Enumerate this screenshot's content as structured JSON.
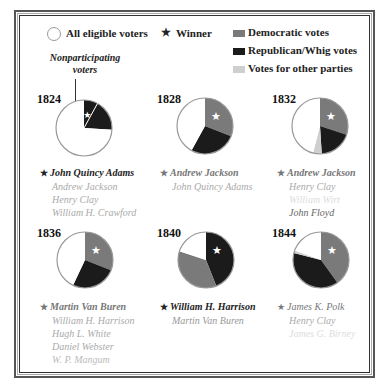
{
  "legend": {
    "all_eligible": "All eligible voters",
    "winner": "Winner",
    "democratic": "Democratic votes",
    "republican_whig": "Republican/Whig votes",
    "other": "Votes for other parties",
    "colors": {
      "democratic": "#7a7a7a",
      "republican_whig": "#1b1b1b",
      "other": "#cfcfcf",
      "nonparticipating": "#ffffff",
      "outline": "#999999"
    }
  },
  "annotation": {
    "line1": "Nonparticipating",
    "line2": "voters"
  },
  "elections": [
    {
      "year": "1824",
      "candidates": [
        {
          "name": "John Quincy Adams",
          "winner": true,
          "style": "bold",
          "color": "#222222"
        },
        {
          "name": "Andrew Jackson",
          "winner": false,
          "style": "normal",
          "color": "#aaaaaa"
        },
        {
          "name": "Henry Clay",
          "winner": false,
          "style": "normal",
          "color": "#aaaaaa"
        },
        {
          "name": "William H. Crawford",
          "winner": false,
          "style": "normal",
          "color": "#aaaaaa"
        }
      ]
    },
    {
      "year": "1828",
      "candidates": [
        {
          "name": "Andrew Jackson",
          "winner": true,
          "style": "bold",
          "color": "#777777"
        },
        {
          "name": "John Quincy Adams",
          "winner": false,
          "style": "normal",
          "color": "#aaaaaa"
        }
      ]
    },
    {
      "year": "1832",
      "candidates": [
        {
          "name": "Andrew Jackson",
          "winner": true,
          "style": "bold",
          "color": "#777777"
        },
        {
          "name": "Henry Clay",
          "winner": false,
          "style": "normal",
          "color": "#aaaaaa"
        },
        {
          "name": "William Wirt",
          "winner": false,
          "style": "normal",
          "color": "#dddddd"
        },
        {
          "name": "John Floyd",
          "winner": false,
          "style": "normal",
          "color": "#666666"
        }
      ]
    },
    {
      "year": "1836",
      "candidates": [
        {
          "name": "Martin Van Buren",
          "winner": true,
          "style": "bold",
          "color": "#777777"
        },
        {
          "name": "William H. Harrison",
          "winner": false,
          "style": "normal",
          "color": "#aaaaaa"
        },
        {
          "name": "Hugh L. White",
          "winner": false,
          "style": "normal",
          "color": "#aaaaaa"
        },
        {
          "name": "Daniel Webster",
          "winner": false,
          "style": "normal",
          "color": "#aaaaaa"
        },
        {
          "name": "W. P. Mangum",
          "winner": false,
          "style": "normal",
          "color": "#bbbbbb"
        }
      ]
    },
    {
      "year": "1840",
      "candidates": [
        {
          "name": "William H. Harrison",
          "winner": true,
          "style": "bold",
          "color": "#222222"
        },
        {
          "name": "Martin Van Buren",
          "winner": false,
          "style": "normal",
          "color": "#999999"
        }
      ]
    },
    {
      "year": "1844",
      "candidates": [
        {
          "name": "James K. Polk",
          "winner": true,
          "style": "normal",
          "color": "#777777"
        },
        {
          "name": "Henry Clay",
          "winner": false,
          "style": "normal",
          "color": "#aaaaaa"
        },
        {
          "name": "James G. Birney",
          "winner": false,
          "style": "normal",
          "color": "#dddddd"
        }
      ]
    }
  ],
  "chart_data": {
    "type": "pie",
    "legend": [
      "All eligible voters",
      "Winner",
      "Democratic votes",
      "Republican/Whig votes",
      "Votes for other parties"
    ],
    "annotations": [
      "Nonparticipating voters"
    ],
    "units": "percent of all eligible voters (estimated from slice angles)",
    "pies": [
      {
        "year": "1824",
        "winner": "John Quincy Adams",
        "slices": [
          {
            "label": "Republican (Adams)",
            "value": 8,
            "color": "#1b1b1b"
          },
          {
            "label": "Republican (others)",
            "value": 18,
            "color": "#1b1b1b"
          },
          {
            "label": "Nonparticipating voters",
            "value": 74,
            "color": "#ffffff"
          }
        ]
      },
      {
        "year": "1828",
        "winner": "Andrew Jackson",
        "slices": [
          {
            "label": "Democratic votes",
            "value": 31,
            "color": "#7a7a7a"
          },
          {
            "label": "Republican/Whig votes",
            "value": 27,
            "color": "#1b1b1b"
          },
          {
            "label": "Nonparticipating voters",
            "value": 42,
            "color": "#ffffff"
          }
        ]
      },
      {
        "year": "1832",
        "winner": "Andrew Jackson",
        "slices": [
          {
            "label": "Democratic votes",
            "value": 30,
            "color": "#7a7a7a"
          },
          {
            "label": "Republican/Whig votes",
            "value": 19,
            "color": "#1b1b1b"
          },
          {
            "label": "Votes for other parties",
            "value": 5,
            "color": "#cfcfcf"
          },
          {
            "label": "Nonparticipating voters",
            "value": 46,
            "color": "#ffffff"
          }
        ]
      },
      {
        "year": "1836",
        "winner": "Martin Van Buren",
        "slices": [
          {
            "label": "Democratic votes",
            "value": 31,
            "color": "#7a7a7a"
          },
          {
            "label": "Republican/Whig votes",
            "value": 26,
            "color": "#1b1b1b"
          },
          {
            "label": "Nonparticipating voters",
            "value": 43,
            "color": "#ffffff"
          }
        ]
      },
      {
        "year": "1840",
        "winner": "William H. Harrison",
        "slices": [
          {
            "label": "Republican/Whig votes",
            "value": 44,
            "color": "#1b1b1b"
          },
          {
            "label": "Democratic votes",
            "value": 36,
            "color": "#7a7a7a"
          },
          {
            "label": "Nonparticipating voters",
            "value": 20,
            "color": "#ffffff"
          }
        ]
      },
      {
        "year": "1844",
        "winner": "James K. Polk",
        "slices": [
          {
            "label": "Democratic votes",
            "value": 40,
            "color": "#7a7a7a"
          },
          {
            "label": "Republican/Whig votes",
            "value": 39,
            "color": "#1b1b1b"
          },
          {
            "label": "Votes for other parties",
            "value": 1.5,
            "color": "#cfcfcf"
          },
          {
            "label": "Nonparticipating voters",
            "value": 19.5,
            "color": "#ffffff"
          }
        ]
      }
    ]
  }
}
